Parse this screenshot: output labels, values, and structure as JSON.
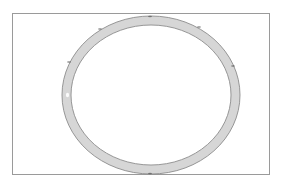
{
  "diagram": {
    "type": "ring",
    "frame": {
      "x": 12.5,
      "y": 13.5,
      "width": 257,
      "height": 161,
      "stroke": "#9a9a9a"
    },
    "ring": {
      "cx": 151,
      "cy": 95,
      "outer_rx": 89,
      "outer_ry": 79,
      "inner_rx": 80,
      "inner_ry": 70,
      "fill": "#d6d6d6",
      "edge_stroke": "#8c8c8c",
      "highlight_color": "#ffffff"
    },
    "marks": [
      {
        "x": 150,
        "y": 16.5
      },
      {
        "x": 100,
        "y": 29
      },
      {
        "x": 199,
        "y": 27
      },
      {
        "x": 69,
        "y": 62
      },
      {
        "x": 233,
        "y": 66
      },
      {
        "x": 150,
        "y": 173.5
      }
    ],
    "mark_color": "#555555"
  }
}
